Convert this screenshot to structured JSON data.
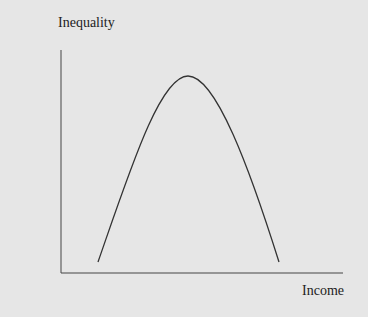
{
  "diagram": {
    "title": "",
    "y_axis_label": "Inequality",
    "x_axis_label": "Income",
    "curve": "inverted-U (Kuznets curve)",
    "colors": {
      "background": "#e6e6e6",
      "line": "#333333"
    }
  }
}
